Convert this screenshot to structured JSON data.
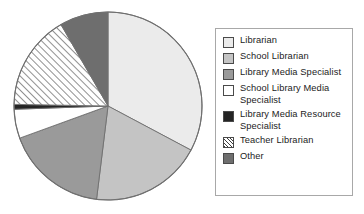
{
  "chart_data": {
    "type": "pie",
    "title": "",
    "subtitle": "",
    "xlabel": "",
    "ylabel": "",
    "grid": false,
    "legend_position": "right",
    "start_angle_deg": 0,
    "direction": "clockwise",
    "categories": [
      "Librarian",
      "School Librarian",
      "Library Media Specialist",
      "School Library Media Specialist",
      "Library Media Resource Specialist",
      "Teacher Librarian",
      "Other"
    ],
    "values": [
      32.8,
      19.2,
      17.5,
      5.0,
      0.8,
      16.4,
      8.3
    ],
    "slices": [
      {
        "label": "Librarian",
        "value": 32.8,
        "start_deg": 0,
        "end_deg": 118,
        "fill": "#ebebeb",
        "pattern": "solid"
      },
      {
        "label": "School Librarian",
        "value": 19.2,
        "start_deg": 118,
        "end_deg": 187,
        "fill": "#c4c4c4",
        "pattern": "solid"
      },
      {
        "label": "Library Media Specialist",
        "value": 17.5,
        "start_deg": 187,
        "end_deg": 250,
        "fill": "#9a9a9a",
        "pattern": "solid"
      },
      {
        "label": "School Library Media Specialist",
        "value": 5.0,
        "start_deg": 250,
        "end_deg": 268,
        "fill": "#ffffff",
        "pattern": "solid"
      },
      {
        "label": "Library Media Resource Specialist",
        "value": 0.8,
        "start_deg": 268,
        "end_deg": 271,
        "fill": "#242424",
        "pattern": "solid"
      },
      {
        "label": "Teacher Librarian",
        "value": 16.4,
        "start_deg": 271,
        "end_deg": 330,
        "fill": "#ffffff",
        "pattern": "diagonal-hatch"
      },
      {
        "label": "Other",
        "value": 8.3,
        "start_deg": 330,
        "end_deg": 360,
        "fill": "#6e6e6e",
        "pattern": "solid"
      }
    ],
    "geometry": {
      "center_x": 108,
      "center_y": 106,
      "radius": 94
    },
    "style": {
      "outline_color": "#6f6f6f",
      "legend_border": "#a8a8a8",
      "background": "#ffffff",
      "text_color": "#1c1c1c"
    }
  },
  "legend": {
    "items": [
      {
        "label": "Librarian",
        "swatch_name": "swatch-librarian"
      },
      {
        "label": "School Librarian",
        "swatch_name": "swatch-school-librarian"
      },
      {
        "label": "Library Media Specialist",
        "swatch_name": "swatch-library-media-specialist"
      },
      {
        "label": "School Library Media Specialist",
        "swatch_name": "swatch-school-library-media-specialist"
      },
      {
        "label": "Library Media Resource Specialist",
        "swatch_name": "swatch-library-media-resource-specialist"
      },
      {
        "label": "Teacher Librarian",
        "swatch_name": "swatch-teacher-librarian"
      },
      {
        "label": "Other",
        "swatch_name": "swatch-other"
      }
    ]
  }
}
